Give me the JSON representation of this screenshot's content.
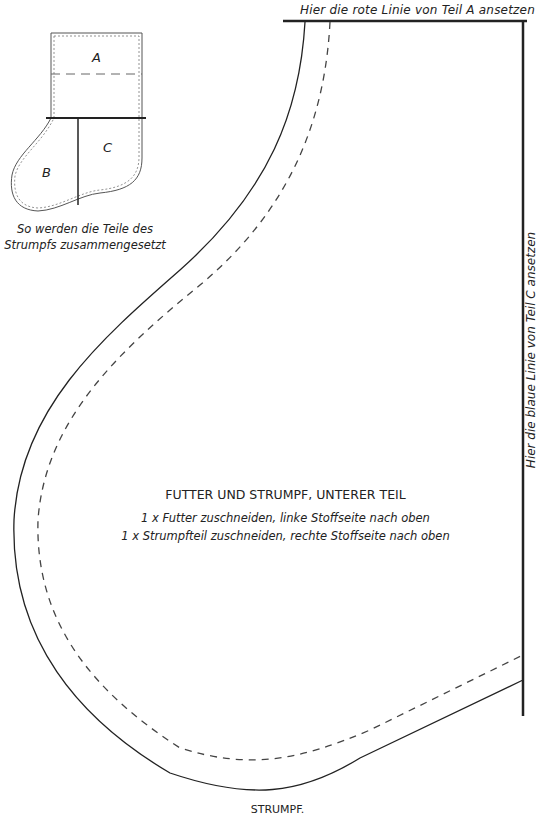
{
  "top_label": "Hier die rote Linie von Teil A ansetzen",
  "side_label": "Hier die blaue Linie von Teil C ansetzen",
  "center": {
    "title": "FUTTER UND STRUMPF, UNTERER TEIL",
    "instructions": [
      "1 x Futter zuschneiden, linke Stoffseite nach oben",
      "1 x Strumpfteil zuschneiden, rechte Stoffseite nach oben"
    ]
  },
  "diagram": {
    "parts": [
      "A",
      "B",
      "C"
    ],
    "caption": [
      "So werden die Teile des",
      "Strumpfs zusammengesetzt"
    ]
  },
  "footer_label": "STRUMPF.",
  "colors": {
    "line": "#222222",
    "dash": "#444444",
    "background": "#ffffff"
  }
}
